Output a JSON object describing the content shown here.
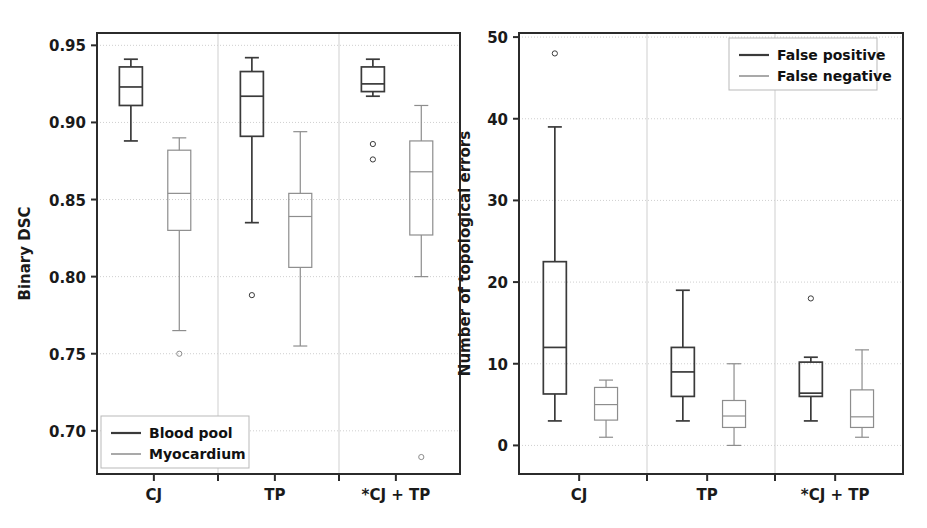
{
  "figure": {
    "background": "#ffffff",
    "series_colors": {
      "primary": "#3a3a3a",
      "secondary": "#8d8d8d"
    },
    "grid_color": "#cfcfcf",
    "frame_color": "#2b2b2b"
  },
  "chart_data": [
    {
      "type": "box",
      "panel": "left",
      "title": "",
      "xlabel": "",
      "ylabel": "Binary DSC",
      "ylim": [
        0.672,
        0.958
      ],
      "yticks": [
        0.95,
        0.9,
        0.85,
        0.8,
        0.75,
        0.7
      ],
      "ytick_labels": [
        "0.95",
        "0.90",
        "0.85",
        "0.80",
        "0.75",
        "0.70"
      ],
      "categories": [
        "CJ",
        "TP",
        "*CJ + TP"
      ],
      "grid": true,
      "legend_position": "lower-left",
      "series": [
        {
          "name": "Blood pool",
          "color": "#3a3a3a",
          "boxes": [
            {
              "category": "CJ",
              "whisker_low": 0.888,
              "q1": 0.911,
              "median": 0.923,
              "q3": 0.936,
              "whisker_high": 0.941,
              "outliers": []
            },
            {
              "category": "TP",
              "whisker_low": 0.835,
              "q1": 0.891,
              "median": 0.917,
              "q3": 0.933,
              "whisker_high": 0.942,
              "outliers": [
                0.788
              ]
            },
            {
              "category": "*CJ + TP",
              "whisker_low": 0.917,
              "q1": 0.92,
              "median": 0.925,
              "q3": 0.936,
              "whisker_high": 0.941,
              "outliers": [
                0.886,
                0.876
              ]
            }
          ]
        },
        {
          "name": "Myocardium",
          "color": "#8d8d8d",
          "boxes": [
            {
              "category": "CJ",
              "whisker_low": 0.765,
              "q1": 0.83,
              "median": 0.854,
              "q3": 0.882,
              "whisker_high": 0.89,
              "outliers": [
                0.75
              ]
            },
            {
              "category": "TP",
              "whisker_low": 0.755,
              "q1": 0.806,
              "median": 0.839,
              "q3": 0.854,
              "whisker_high": 0.894,
              "outliers": []
            },
            {
              "category": "*CJ + TP",
              "whisker_low": 0.8,
              "q1": 0.827,
              "median": 0.868,
              "q3": 0.888,
              "whisker_high": 0.911,
              "outliers": [
                0.683
              ]
            }
          ]
        }
      ]
    },
    {
      "type": "box",
      "panel": "right",
      "title": "",
      "xlabel": "",
      "ylabel": "Number of topological errors",
      "ylim": [
        -3.5,
        50.5
      ],
      "yticks": [
        50,
        40,
        30,
        20,
        10,
        0
      ],
      "ytick_labels": [
        "50",
        "40",
        "30",
        "20",
        "10",
        "0"
      ],
      "categories": [
        "CJ",
        "TP",
        "*CJ + TP"
      ],
      "grid": true,
      "legend_position": "upper-right",
      "series": [
        {
          "name": "False positive",
          "color": "#3a3a3a",
          "boxes": [
            {
              "category": "CJ",
              "whisker_low": 3,
              "q1": 6.3,
              "median": 12,
              "q3": 22.5,
              "whisker_high": 39,
              "outliers": [
                48
              ]
            },
            {
              "category": "TP",
              "whisker_low": 3,
              "q1": 6,
              "median": 9,
              "q3": 12,
              "whisker_high": 19,
              "outliers": []
            },
            {
              "category": "*CJ + TP",
              "whisker_low": 3,
              "q1": 6,
              "median": 6.4,
              "q3": 10.2,
              "whisker_high": 10.8,
              "outliers": [
                18
              ]
            }
          ]
        },
        {
          "name": "False negative",
          "color": "#8d8d8d",
          "boxes": [
            {
              "category": "CJ",
              "whisker_low": 1,
              "q1": 3.1,
              "median": 5,
              "q3": 7.1,
              "whisker_high": 8,
              "outliers": []
            },
            {
              "category": "TP",
              "whisker_low": 0,
              "q1": 2.2,
              "median": 3.6,
              "q3": 5.5,
              "whisker_high": 10,
              "outliers": []
            },
            {
              "category": "*CJ + TP",
              "whisker_low": 1,
              "q1": 2.2,
              "median": 3.5,
              "q3": 6.8,
              "whisker_high": 11.7,
              "outliers": []
            }
          ]
        }
      ]
    }
  ]
}
